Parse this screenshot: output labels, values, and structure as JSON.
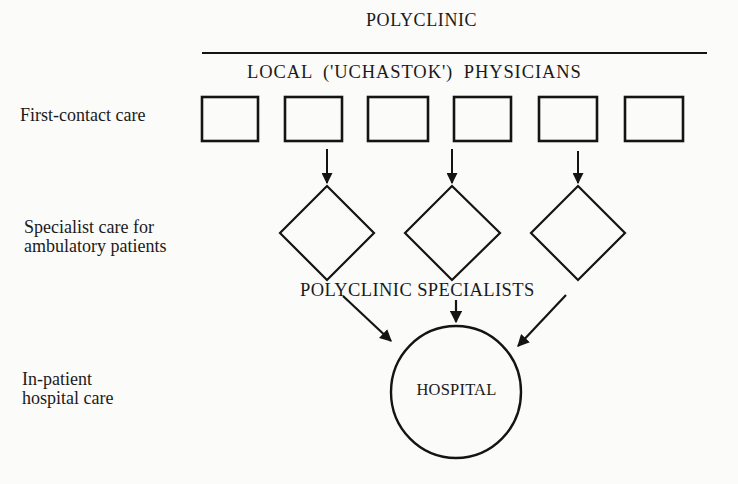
{
  "diagram": {
    "title": "POLYCLINIC",
    "subtitle": "LOCAL  ('UCHASTOK')  PHYSICIANS",
    "levels": [
      {
        "id": "first-contact",
        "label_lines": [
          "First-contact care"
        ]
      },
      {
        "id": "specialist",
        "label_lines": [
          "Specialist care for",
          "ambulatory patients"
        ]
      },
      {
        "id": "inpatient",
        "label_lines": [
          "In-patient",
          "hospital care"
        ]
      }
    ],
    "physician_boxes": {
      "count": 6,
      "shape": "rectangle"
    },
    "specialist_nodes": {
      "count": 3,
      "shape": "diamond",
      "group_label": "POLYCLINIC SPECIALISTS"
    },
    "hospital_node": {
      "shape": "circle",
      "label": "HOSPITAL"
    },
    "edges": [
      {
        "from": "physician-box-2",
        "to": "specialist-diamond-1"
      },
      {
        "from": "physician-box-3/4",
        "to": "specialist-diamond-2"
      },
      {
        "from": "physician-box-5",
        "to": "specialist-diamond-3"
      },
      {
        "from": "specialist-diamond-1",
        "to": "hospital"
      },
      {
        "from": "specialist-diamond-2",
        "to": "hospital"
      },
      {
        "from": "specialist-diamond-3",
        "to": "hospital"
      }
    ],
    "colors": {
      "ink": "#141414",
      "paper": "#fbfbfa"
    }
  }
}
